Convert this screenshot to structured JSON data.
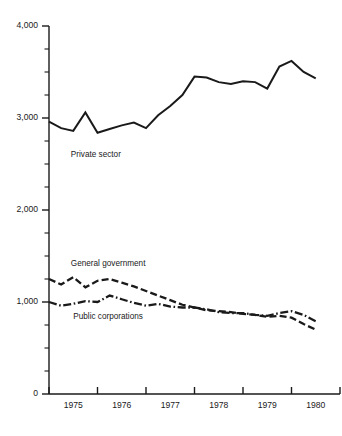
{
  "chart_data": {
    "type": "line",
    "title": "",
    "xlabel": "",
    "ylabel": "",
    "ylim": [
      0,
      4000
    ],
    "xlim": [
      1974.5,
      1980.75
    ],
    "grid": false,
    "legend_position": "inline-annotations",
    "y_ticks_major": [
      0,
      1000,
      2000,
      3000,
      4000
    ],
    "y_tick_labels": [
      "0",
      "1,000",
      "2,000",
      "3,000",
      "4,000"
    ],
    "y_minor_interval": 250,
    "x_ticks": [
      1975,
      1976,
      1977,
      1978,
      1979,
      1980,
      1981
    ],
    "x_tick_labels": [
      "1975",
      "1976",
      "1977",
      "1978",
      "1979",
      "1980"
    ],
    "series": [
      {
        "name": "Private sector",
        "style": "solid",
        "label_x": 1975.45,
        "label_y": 2580,
        "x": [
          1975.0,
          1975.25,
          1975.5,
          1975.75,
          1976.0,
          1976.25,
          1976.5,
          1976.75,
          1977.0,
          1977.25,
          1977.5,
          1977.75,
          1978.0,
          1978.25,
          1978.5,
          1978.75,
          1979.0,
          1979.25,
          1979.5,
          1979.75,
          1980.0,
          1980.25,
          1980.5
        ],
        "values": [
          2960,
          2890,
          2860,
          3060,
          2840,
          2880,
          2920,
          2950,
          2890,
          3030,
          3130,
          3250,
          3450,
          3440,
          3390,
          3370,
          3400,
          3390,
          3320,
          3560,
          3620,
          3500,
          3430
        ]
      },
      {
        "name": "General government",
        "style": "dashed",
        "label_x": 1975.45,
        "label_y": 1390,
        "x": [
          1975.0,
          1975.25,
          1975.5,
          1975.75,
          1976.0,
          1976.25,
          1976.5,
          1976.75,
          1977.0,
          1977.25,
          1977.5,
          1977.75,
          1978.0,
          1978.25,
          1978.5,
          1978.75,
          1979.0,
          1979.25,
          1979.5,
          1979.75,
          1980.0,
          1980.25,
          1980.5
        ],
        "values": [
          1250,
          1190,
          1270,
          1160,
          1230,
          1250,
          1210,
          1170,
          1120,
          1070,
          1020,
          970,
          940,
          910,
          900,
          890,
          870,
          860,
          840,
          850,
          830,
          760,
          700
        ]
      },
      {
        "name": "Public corporations",
        "style": "dash-dot",
        "label_x": 1975.5,
        "label_y": 820,
        "x": [
          1975.0,
          1975.25,
          1975.5,
          1975.75,
          1976.0,
          1976.25,
          1976.5,
          1976.75,
          1977.0,
          1977.25,
          1977.5,
          1977.75,
          1978.0,
          1978.25,
          1978.5,
          1978.75,
          1979.0,
          1979.25,
          1979.5,
          1979.75,
          1980.0,
          1980.25,
          1980.5
        ],
        "values": [
          1000,
          960,
          980,
          1010,
          1000,
          1070,
          1030,
          990,
          960,
          980,
          950,
          940,
          940,
          920,
          890,
          880,
          880,
          860,
          850,
          880,
          900,
          860,
          790
        ]
      }
    ]
  },
  "colors": {
    "ink": "#1a1a1a",
    "background": "#ffffff"
  }
}
